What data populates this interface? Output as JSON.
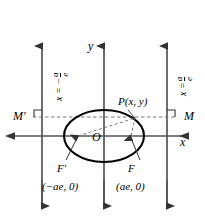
{
  "figure": {
    "type": "ellipse-focus-directrix-diagram",
    "axes": {
      "x_label": "x",
      "y_label": "y",
      "origin_label": "O"
    },
    "point_on_curve": {
      "label": "P(x, y)"
    },
    "directrix_feet": {
      "right_label": "M",
      "left_label": "M′"
    },
    "foci": {
      "right_label": "F",
      "left_label": "F′",
      "right_coords": "(ae, 0)",
      "left_coords": "(−ae, 0)"
    },
    "directrices": {
      "right": {
        "var": "x",
        "eq": "=",
        "sign": "",
        "num": "a",
        "den": "e"
      },
      "left": {
        "var": "x",
        "eq": "=",
        "sign": "−",
        "num": "a",
        "den": "e"
      }
    },
    "colors": {
      "stroke": "#000000",
      "axis": "#555555",
      "dashed": "#777777",
      "background": "#ffffff"
    }
  }
}
